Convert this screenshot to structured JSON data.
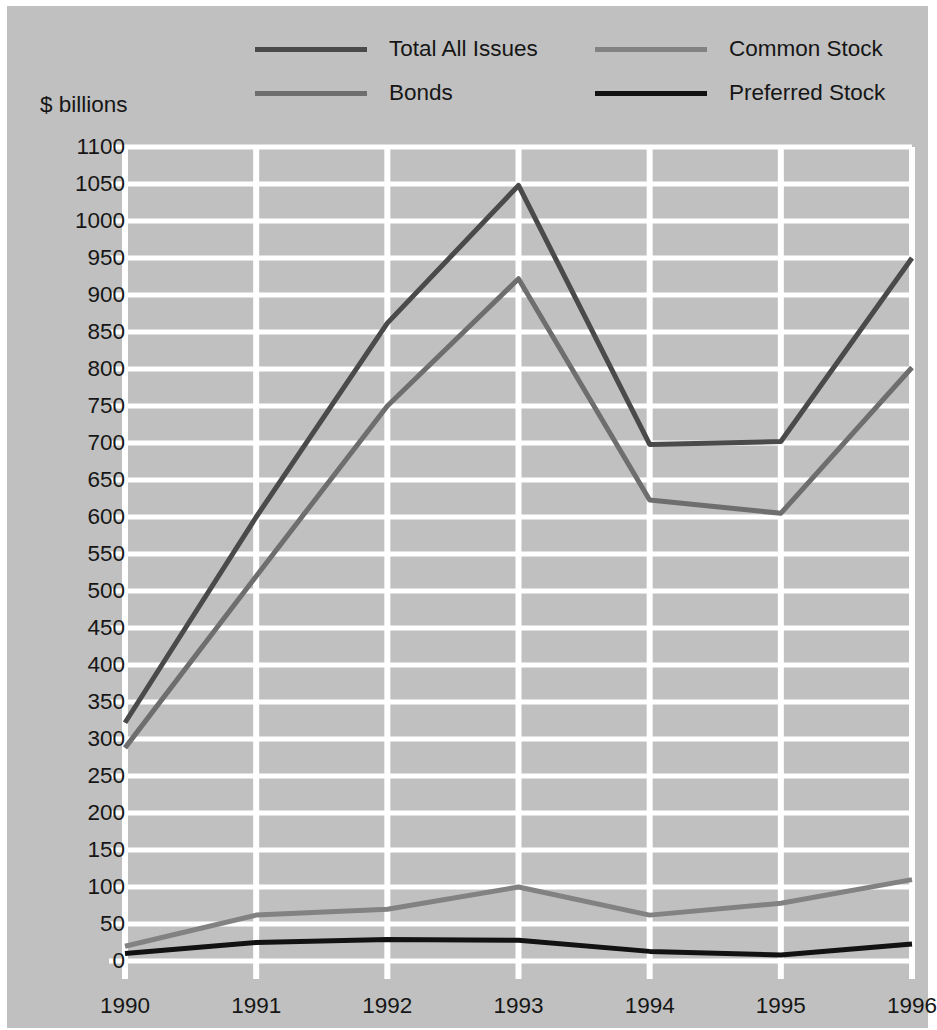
{
  "chart_data": {
    "type": "line",
    "title": "",
    "subtitle": "",
    "xlabel": "",
    "ylabel": "$ billions",
    "categories": [
      "1990",
      "1991",
      "1992",
      "1993",
      "1994",
      "1995",
      "1996"
    ],
    "x": [
      1990,
      1991,
      1992,
      1993,
      1994,
      1995,
      1996
    ],
    "ylim": [
      0,
      1100
    ],
    "ytick_step": 50,
    "yticks": [
      0,
      50,
      100,
      150,
      200,
      250,
      300,
      350,
      400,
      450,
      500,
      550,
      600,
      650,
      700,
      750,
      800,
      850,
      900,
      950,
      1000,
      1050,
      1100
    ],
    "ytick_labels": [
      "0",
      "50",
      "100",
      "150",
      "200",
      "250",
      "300",
      "350",
      "400",
      "450",
      "500",
      "550",
      "600",
      "650",
      "700",
      "750",
      "800",
      "850",
      "900",
      "950",
      "1000",
      "1050",
      "1100"
    ],
    "grid": true,
    "grid_color": "#ffffff",
    "plot_background": "#c0c0c0",
    "legend_position": "top",
    "series": [
      {
        "name": "Total All Issues",
        "color": "#4a4a4a",
        "width": 5,
        "values": [
          322,
          600,
          862,
          1048,
          698,
          702,
          950
        ]
      },
      {
        "name": "Bonds",
        "color": "#6e6e6e",
        "width": 5,
        "values": [
          288,
          520,
          750,
          922,
          623,
          605,
          802
        ]
      },
      {
        "name": "Common Stock",
        "color": "#828282",
        "width": 5,
        "values": [
          20,
          62,
          70,
          100,
          62,
          78,
          110
        ]
      },
      {
        "name": "Preferred Stock",
        "color": "#121212",
        "width": 5,
        "values": [
          10,
          25,
          29,
          28,
          13,
          8,
          23
        ]
      }
    ]
  },
  "legend": {
    "entries": [
      {
        "label": "Total All Issues"
      },
      {
        "label": "Common Stock"
      },
      {
        "label": "Bonds"
      },
      {
        "label": "Preferred Stock"
      }
    ]
  },
  "axis": {
    "y_unit_caption": "$ billions"
  }
}
